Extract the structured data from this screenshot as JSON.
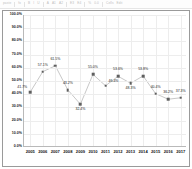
{
  "toolbar": {
    "items": [
      "paste",
      "fx",
      "B",
      "I",
      "U",
      "A",
      "A1",
      "A2",
      "E3",
      "E4",
      "%",
      "0.0",
      "Cells",
      "Edit"
    ]
  },
  "chart_data": {
    "type": "line",
    "title": "",
    "xlabel": "",
    "ylabel": "",
    "ylim": [
      0,
      100
    ],
    "ytick_labels": [
      "100.0%",
      "90.0%",
      "80.0%",
      "70.0%",
      "60.0%",
      "50.0%",
      "40.0%",
      "30.0%",
      "20.0%",
      "10.0%",
      "0.0%"
    ],
    "ytick_values": [
      100,
      90,
      80,
      70,
      60,
      50,
      40,
      30,
      20,
      10,
      0
    ],
    "categories": [
      "2005",
      "2006",
      "2007",
      "2008",
      "2009",
      "2010",
      "2011",
      "2012",
      "2013",
      "2014",
      "2015",
      "2016",
      "2017"
    ],
    "values": [
      41.7,
      57.1,
      61.5,
      43.2,
      32.4,
      55.0,
      46.4,
      53.6,
      48.3,
      53.8,
      40.4,
      36.2,
      37.3
    ],
    "point_labels": [
      "41.7%",
      "57.1%",
      "61.5%",
      "43.2%",
      "32.4%",
      "55.0%",
      "46.4%",
      "53.6%",
      "48.3%",
      "53.8%",
      "40.4%",
      "36.2%",
      "37.3%"
    ],
    "label_positions": [
      "left",
      "above",
      "above",
      "above",
      "below",
      "above",
      "right",
      "above",
      "below",
      "above",
      "above",
      "above",
      "above"
    ],
    "grid": true,
    "legend": "none",
    "series_color": "#c8c8c8",
    "marker_color": "#5f5f5f"
  }
}
